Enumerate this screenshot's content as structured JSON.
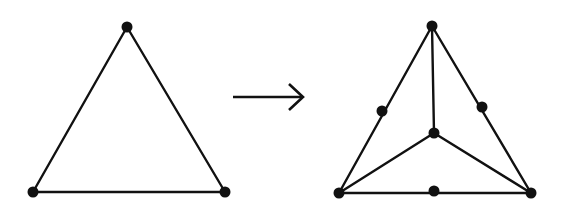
{
  "diagram": {
    "type": "graph-transformation",
    "stroke_color": "#111111",
    "node_color": "#111111",
    "left_graph": {
      "name": "triangle",
      "nodes": [
        {
          "id": "top",
          "x": 127,
          "y": 27
        },
        {
          "id": "bottom-left",
          "x": 33,
          "y": 192
        },
        {
          "id": "bottom-right",
          "x": 225,
          "y": 192
        }
      ],
      "edges": [
        [
          "top",
          "bottom-left"
        ],
        [
          "top",
          "bottom-right"
        ],
        [
          "bottom-left",
          "bottom-right"
        ]
      ]
    },
    "arrow": {
      "x1": 233,
      "y1": 97,
      "x2": 302,
      "y2": 97
    },
    "right_graph": {
      "name": "subdivided-triangle",
      "nodes": [
        {
          "id": "top",
          "x": 432,
          "y": 26
        },
        {
          "id": "bottom-left",
          "x": 339,
          "y": 193
        },
        {
          "id": "bottom-right",
          "x": 531,
          "y": 193
        },
        {
          "id": "center",
          "x": 434,
          "y": 133
        },
        {
          "id": "left-mid",
          "x": 382,
          "y": 111
        },
        {
          "id": "right-mid",
          "x": 482,
          "y": 107
        },
        {
          "id": "bottom-mid",
          "x": 434,
          "y": 191
        }
      ],
      "edges": [
        [
          "top",
          "bottom-left"
        ],
        [
          "top",
          "bottom-right"
        ],
        [
          "bottom-left",
          "bottom-right"
        ],
        [
          "top",
          "center"
        ],
        [
          "center",
          "bottom-left"
        ],
        [
          "center",
          "bottom-right"
        ]
      ]
    }
  }
}
